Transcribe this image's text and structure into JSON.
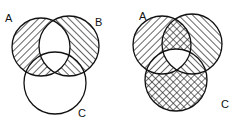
{
  "diagrams": [
    {
      "id": "left",
      "description": "Symmetric difference of A and B (A xor B), C unshaded",
      "labels": {
        "a": "A",
        "b": "B",
        "c": "C"
      },
      "circles": {
        "a": {
          "cx": 41,
          "cy": 47,
          "r": 29
        },
        "b": {
          "cx": 69,
          "cy": 46,
          "r": 30
        },
        "c": {
          "cx": 55,
          "cy": 83,
          "r": 31
        }
      },
      "label_positions": {
        "a": {
          "x": 5,
          "y": 22
        },
        "b": {
          "x": 95,
          "y": 26
        },
        "c": {
          "x": 78,
          "y": 117
        }
      }
    },
    {
      "id": "right",
      "description": "A xor B hatched; (A∩B) xor C cross-hatched; A∩B∩C white",
      "labels": {
        "a": "A",
        "c": "C"
      },
      "circles": {
        "a": {
          "cx": 162,
          "cy": 45,
          "r": 29
        },
        "b": {
          "cx": 192,
          "cy": 44,
          "r": 30
        },
        "c": {
          "cx": 176,
          "cy": 80,
          "r": 31
        }
      },
      "label_positions": {
        "a": {
          "x": 139,
          "y": 20
        },
        "c": {
          "x": 221,
          "y": 108
        }
      }
    }
  ],
  "colors": {
    "stroke": "#111111",
    "background": "#ffffff"
  }
}
